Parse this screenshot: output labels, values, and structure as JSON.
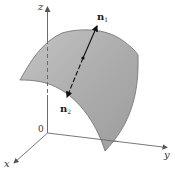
{
  "figure": {
    "axes": {
      "x_label": "x",
      "y_label": "y",
      "z_label": "z",
      "origin_label": "0"
    },
    "normals": [
      {
        "name": "n",
        "subscript": "1",
        "direction": "up-right"
      },
      {
        "name": "n",
        "subscript": "2",
        "direction": "down-left"
      }
    ],
    "colors": {
      "surface_fill": "#a9a9a9",
      "surface_edge": "#6e6e6e",
      "axis": "#6a6a6a",
      "normal_line": "#1a1a1a",
      "background": "#ffffff"
    }
  }
}
